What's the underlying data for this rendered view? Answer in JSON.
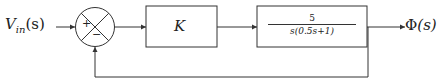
{
  "input": {
    "symbol": "V",
    "subscript": "in",
    "arg": "(s)"
  },
  "summing_junction": {
    "plus": "+",
    "minus": "−"
  },
  "blocks": [
    {
      "name": "gain",
      "label": "K"
    },
    {
      "name": "plant",
      "numerator": "5",
      "denominator": "s(0.5s+1)"
    }
  ],
  "output": {
    "symbol": "Φ",
    "arg": "(s)"
  },
  "feedback": "unity negative feedback"
}
